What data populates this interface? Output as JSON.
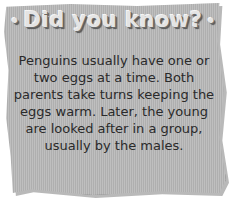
{
  "card": {
    "title": "Did you know?",
    "title_bullet": "•",
    "body": "Penguins usually have one or two eggs at a time. Both parents take turns keeping the eggs warm. Later, the young are looked after in a group, usually by the males."
  },
  "colors": {
    "card_background": "#b8b8b8",
    "title_text": "#e4e4e4",
    "body_text": "#2a2a2a",
    "page_background": "#ffffff"
  }
}
